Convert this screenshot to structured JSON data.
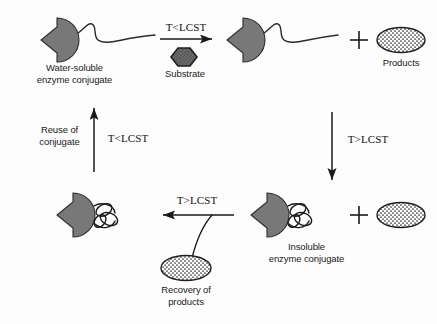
{
  "figure": {
    "type": "diagram",
    "background_color": "#fdfdfd",
    "enzyme_color": "#787878",
    "outline_color": "#1a1a1a"
  },
  "labels": {
    "water_soluble_conjugate": "Water-soluble\nenzyme conjugate",
    "substrate": "Substrate",
    "products_top": "Products",
    "insoluble_conjugate": "Insoluble\nenzyme conjugate",
    "recovery_of_products": "Recovery of\nproducts",
    "reuse_of_conjugate": "Reuse of\nconjugate"
  },
  "conditions": {
    "top_arrow": "T<LCST",
    "right_arrow": "T>LCST",
    "bottom_arrow": "T>LCST",
    "left_arrow": "T<LCST"
  },
  "operators": {
    "plus_top": "+",
    "plus_bottom": "+"
  },
  "nodes": [
    {
      "name": "water-soluble-enzyme-conjugate",
      "state": "extended-coil",
      "position": "top-left"
    },
    {
      "name": "substrate-hexagon",
      "state": "reactant",
      "position": "top-center"
    },
    {
      "name": "enzyme-conjugate-product-state",
      "state": "extended-coil",
      "position": "top-right"
    },
    {
      "name": "products-ellipse-top",
      "state": "product",
      "position": "top-far-right"
    },
    {
      "name": "insoluble-enzyme-conjugate",
      "state": "collapsed-coil",
      "position": "bottom-right"
    },
    {
      "name": "products-ellipse-bottom",
      "state": "product",
      "position": "bottom-far-right"
    },
    {
      "name": "recovered-conjugate",
      "state": "collapsed-coil",
      "position": "bottom-left"
    },
    {
      "name": "recovery-products-ellipse",
      "state": "recovered-product",
      "position": "bottom-center"
    }
  ]
}
